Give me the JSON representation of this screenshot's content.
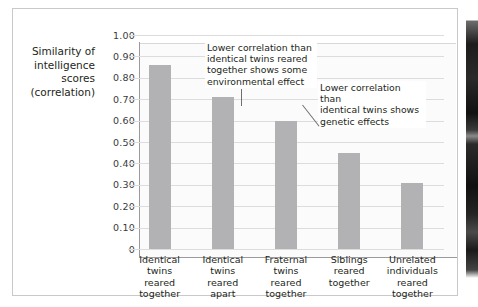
{
  "figure": {
    "y_axis_title_lines": [
      "Similarity of",
      "intelligence",
      "scores",
      "(correlation)"
    ],
    "bar_color": "#b2b2b4",
    "grid_color": "#dcdcdc",
    "axis_color": "#9a9a9c",
    "frame_color": "#c9c9cb"
  },
  "chart_data": {
    "type": "bar",
    "title": "",
    "xlabel": "",
    "ylabel": "Similarity of intelligence scores (correlation)",
    "ylim": [
      0,
      1.0
    ],
    "grid": true,
    "legend": "none",
    "ytick_labels": [
      "1.00",
      "0.90",
      "0.80",
      "0.70",
      "0.60",
      "0.50",
      "0.40",
      "0.30",
      "0.20",
      "0.10",
      "0"
    ],
    "ytick_values": [
      1.0,
      0.9,
      0.8,
      0.7,
      0.6,
      0.5,
      0.4,
      0.3,
      0.2,
      0.1,
      0
    ],
    "categories": [
      "Identical twins reared together",
      "Identical twins reared apart",
      "Fraternal twins reared together",
      "Siblings reared together",
      "Unrelated individuals reared together"
    ],
    "category_label_lines": [
      [
        "Identical",
        "twins",
        "reared",
        "together"
      ],
      [
        "Identical",
        "twins",
        "reared",
        "apart"
      ],
      [
        "Fraternal",
        "twins",
        "reared",
        "together"
      ],
      [
        "Siblings",
        "reared",
        "together"
      ],
      [
        "Unrelated",
        "individuals",
        "reared",
        "together"
      ]
    ],
    "values": [
      0.86,
      0.71,
      0.6,
      0.45,
      0.31
    ],
    "annotations": [
      {
        "id": "annotation-1",
        "lines": [
          "Lower correlation than",
          "identical twins reared",
          "together shows some",
          "environmental effect"
        ],
        "points_to": "Identical twins reared apart"
      },
      {
        "id": "annotation-2",
        "lines": [
          "Lower correlation than",
          "identical twins shows",
          "genetic effects"
        ],
        "points_to": "Fraternal twins reared together"
      }
    ]
  }
}
